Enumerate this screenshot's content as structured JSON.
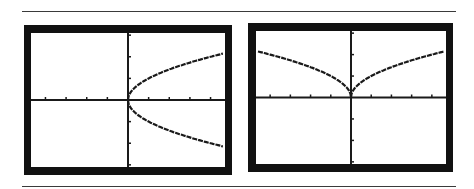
{
  "chart_data": [
    {
      "type": "line",
      "title": "",
      "description": "Graphing calculator screen: sideways parabola x = y^2 (y = ±√x)",
      "xlabel": "",
      "ylabel": "",
      "xlim": [
        -4.7,
        4.7
      ],
      "ylim": [
        -3.1,
        3.1
      ],
      "x_ticks": [
        -4,
        -3,
        -2,
        -1,
        1,
        2,
        3,
        4
      ],
      "y_ticks": [
        -3,
        -2,
        -1,
        1,
        2,
        3
      ],
      "grid": false,
      "series": [
        {
          "name": "upper branch y = √x",
          "x": [
            0,
            0.25,
            0.5,
            1,
            2,
            3,
            4,
            4.6
          ],
          "y": [
            0,
            0.5,
            0.71,
            1,
            1.41,
            1.73,
            2,
            2.14
          ]
        },
        {
          "name": "lower branch y = -√x",
          "x": [
            0,
            0.25,
            0.5,
            1,
            2,
            3,
            4,
            4.6
          ],
          "y": [
            0,
            -0.5,
            -0.71,
            -1,
            -1.41,
            -1.73,
            -2,
            -2.14
          ]
        }
      ]
    },
    {
      "type": "line",
      "title": "",
      "description": "Graphing calculator screen: y = √|x|",
      "xlabel": "",
      "ylabel": "",
      "xlim": [
        -4.7,
        4.7
      ],
      "ylim": [
        -3.1,
        3.1
      ],
      "x_ticks": [
        -4,
        -3,
        -2,
        -1,
        1,
        2,
        3,
        4
      ],
      "y_ticks": [
        -3,
        -2,
        -1,
        1,
        2,
        3
      ],
      "grid": false,
      "series": [
        {
          "name": "y = √|x|",
          "x": [
            -4.6,
            -4,
            -3,
            -2,
            -1,
            -0.5,
            -0.25,
            0,
            0.25,
            0.5,
            1,
            2,
            3,
            4,
            4.6
          ],
          "y": [
            2.14,
            2,
            1.73,
            1.41,
            1,
            0.71,
            0.5,
            0,
            0.5,
            0.71,
            1,
            1.41,
            1.73,
            2,
            2.14
          ]
        }
      ]
    }
  ],
  "style": {
    "frame_color": "#111111",
    "screen_color": "#ffffff",
    "curve_color": "#1a1a1a",
    "rule_color": "#3a3a3a"
  }
}
